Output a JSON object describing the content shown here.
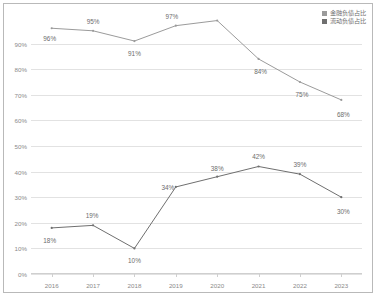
{
  "legend": {
    "position": "top-right",
    "entries": [
      {
        "label": "金融负债占比",
        "color": "#9b9b9b"
      },
      {
        "label": "流动负债占比",
        "color": "#6f6f6f"
      }
    ]
  },
  "axes": {
    "y_ticks": [
      "0%",
      "10%",
      "20%",
      "30%",
      "40%",
      "50%",
      "60%",
      "70%",
      "80%",
      "90%"
    ],
    "x_ticks": [
      "2016",
      "2017",
      "2018",
      "2019",
      "2020",
      "2021",
      "2022",
      "2023"
    ]
  },
  "chart_data": {
    "type": "line",
    "title": "",
    "xlabel": "",
    "ylabel": "",
    "grid": true,
    "legend_position": "top-right",
    "ylim": [
      0,
      100
    ],
    "ytick_values": [
      0,
      10,
      20,
      30,
      40,
      50,
      60,
      70,
      80,
      90
    ],
    "categories": [
      "2016",
      "2017",
      "2018",
      "2019",
      "2020",
      "2021",
      "2022",
      "2023"
    ],
    "series": [
      {
        "name": "金融负债占比",
        "color": "#9b9b9b",
        "values": [
          96,
          95,
          91,
          97,
          99,
          84,
          75,
          68
        ],
        "point_labels": [
          "96%",
          "95%",
          "91%",
          "97%",
          "",
          "84%",
          "75%",
          "68%"
        ]
      },
      {
        "name": "流动负债占比",
        "color": "#6f6f6f",
        "values": [
          18,
          19,
          10,
          34,
          38,
          42,
          39,
          30
        ],
        "point_labels": [
          "18%",
          "19%",
          "10%",
          "34%",
          "38%",
          "42%",
          "39%",
          "30%"
        ]
      }
    ]
  }
}
